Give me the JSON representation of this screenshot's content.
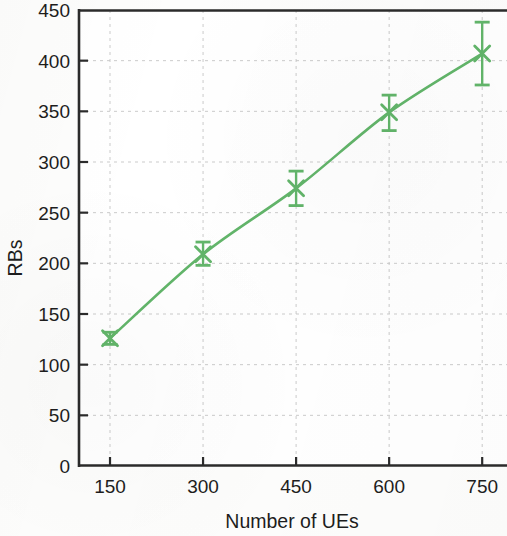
{
  "chart_data": {
    "type": "line",
    "title": "",
    "subtitle": "",
    "xlabel": "Number of UEs",
    "ylabel": "RBs",
    "x": [
      150,
      300,
      450,
      600,
      750
    ],
    "categories": [
      "150",
      "300",
      "450",
      "600",
      "750"
    ],
    "series": [
      {
        "name": "RBs",
        "values": [
          126,
          209,
          274,
          349,
          407
        ],
        "error_low": [
          120,
          198,
          257,
          331,
          376
        ],
        "error_high": [
          132,
          221,
          291,
          366,
          438
        ],
        "color": "#62b56a",
        "marker": "x",
        "line_style": "solid"
      }
    ],
    "xlim": [
      100,
      790
    ],
    "ylim": [
      0,
      450
    ],
    "xticks": [
      150,
      300,
      450,
      600,
      750
    ],
    "yticks": [
      0,
      50,
      100,
      150,
      200,
      250,
      300,
      350,
      400,
      450
    ],
    "xtick_labels": [
      "150",
      "300",
      "450",
      "600",
      "750"
    ],
    "ytick_labels": [
      "0",
      "50",
      "100",
      "150",
      "200",
      "250",
      "300",
      "350",
      "400",
      "450"
    ],
    "grid": true,
    "grid_color": "#c8c8c8",
    "grid_style": "dashed",
    "legend": null,
    "legend_position": "none",
    "axis_color": "#2a2a2a",
    "background_color": "#ffffff",
    "errorbars": true,
    "annotations": []
  },
  "axes": {
    "y_label": "RBs",
    "x_label": "Number of UEs",
    "y_ticks": [
      {
        "label": "450",
        "value": 450
      },
      {
        "label": "400",
        "value": 400
      },
      {
        "label": "350",
        "value": 350
      },
      {
        "label": "300",
        "value": 300
      },
      {
        "label": "250",
        "value": 250
      },
      {
        "label": "200",
        "value": 200
      },
      {
        "label": "150",
        "value": 150
      },
      {
        "label": "100",
        "value": 100
      },
      {
        "label": "50",
        "value": 50
      },
      {
        "label": "0",
        "value": 0
      }
    ],
    "x_ticks": [
      {
        "label": "150",
        "value": 150
      },
      {
        "label": "300",
        "value": 300
      },
      {
        "label": "450",
        "value": 450
      },
      {
        "label": "600",
        "value": 600
      },
      {
        "label": "750",
        "value": 750
      }
    ]
  }
}
